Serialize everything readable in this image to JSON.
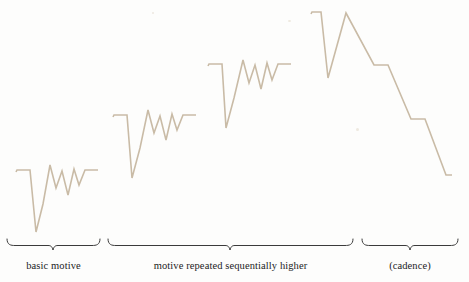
{
  "figure": {
    "background_color": "#fdfdfc",
    "contour_color": "#c9bba6",
    "bracket_color": "#3b3b3b",
    "caption_color": "#1c1c1c",
    "width": 469,
    "height": 282
  },
  "captions": [
    {
      "id": "basic-motive",
      "text": "basic motive"
    },
    {
      "id": "motive-repeated",
      "text": "motive repeated sequentially higher"
    },
    {
      "id": "cadence",
      "text": "(cadence)"
    }
  ],
  "chart_data": {
    "type": "line",
    "subtitle": "",
    "xlabel": "",
    "ylabel": "",
    "grid": false,
    "legend": "none",
    "axis_visible": false,
    "xlim": [
      0,
      469
    ],
    "ylim": [
      282,
      0
    ],
    "note": "y values are screen pixels, smaller y = higher pitch",
    "series": [
      {
        "name": "basic motive",
        "color": "#c9bba6",
        "points": [
          [
            16,
            172
          ],
          [
            17,
            170
          ],
          [
            30,
            170
          ],
          [
            36,
            232
          ],
          [
            43,
            204
          ],
          [
            50,
            165
          ],
          [
            56,
            188
          ],
          [
            62,
            171
          ],
          [
            68,
            195
          ],
          [
            74,
            169
          ],
          [
            79,
            185
          ],
          [
            85,
            170
          ],
          [
            98,
            170
          ]
        ]
      },
      {
        "name": "motive repeated sequentially higher - statement 2",
        "color": "#c9bba6",
        "points": [
          [
            113,
            117
          ],
          [
            114,
            115
          ],
          [
            127,
            115
          ],
          [
            132,
            178
          ],
          [
            140,
            148
          ],
          [
            148,
            110
          ],
          [
            154,
            133
          ],
          [
            160,
            116
          ],
          [
            166,
            140
          ],
          [
            172,
            114
          ],
          [
            177,
            130
          ],
          [
            183,
            115
          ],
          [
            196,
            115
          ]
        ]
      },
      {
        "name": "motive repeated sequentially higher - statement 3",
        "color": "#c9bba6",
        "points": [
          [
            208,
            66
          ],
          [
            209,
            64
          ],
          [
            222,
            64
          ],
          [
            226,
            128
          ],
          [
            234,
            98
          ],
          [
            243,
            60
          ],
          [
            249,
            83
          ],
          [
            255,
            65
          ],
          [
            261,
            89
          ],
          [
            267,
            63
          ],
          [
            272,
            80
          ],
          [
            278,
            64
          ],
          [
            291,
            64
          ]
        ]
      },
      {
        "name": "cadence",
        "color": "#c9bba6",
        "points": [
          [
            311,
            14
          ],
          [
            312,
            12
          ],
          [
            321,
            12
          ],
          [
            328,
            78
          ],
          [
            346,
            13
          ],
          [
            374,
            65
          ],
          [
            388,
            65
          ],
          [
            411,
            119
          ],
          [
            425,
            119
          ],
          [
            446,
            175
          ],
          [
            452,
            175
          ]
        ]
      }
    ],
    "brackets": [
      {
        "label": "basic motive",
        "x_start": 7,
        "x_end": 100,
        "y": 240,
        "tip_x": 53,
        "tip_y": 250
      },
      {
        "label": "motive repeated sequentially higher",
        "x_start": 108,
        "x_end": 353,
        "y": 240,
        "tip_x": 230,
        "tip_y": 250
      },
      {
        "label": "(cadence)",
        "x_start": 362,
        "x_end": 458,
        "y": 240,
        "tip_x": 410,
        "tip_y": 250
      }
    ]
  }
}
